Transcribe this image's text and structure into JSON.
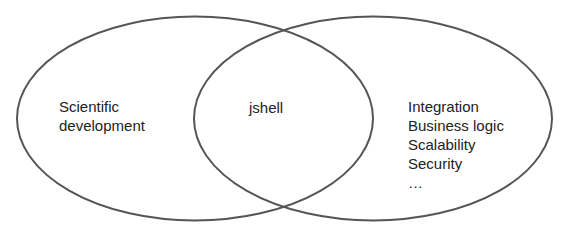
{
  "diagram": {
    "type": "venn",
    "sets": [
      {
        "id": "left",
        "label_lines": [
          "Scientific",
          "development"
        ]
      },
      {
        "id": "right",
        "label_lines": [
          "Integration",
          "Business logic",
          "Scalability",
          "Security",
          "…"
        ]
      }
    ],
    "intersection": {
      "label": "jshell"
    },
    "colors": {
      "outline": "#555555",
      "text": "#222222",
      "background": "#ffffff"
    }
  }
}
